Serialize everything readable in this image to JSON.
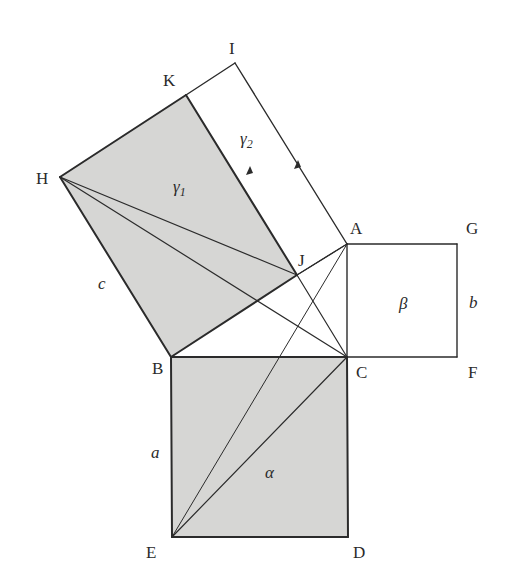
{
  "figure": {
    "colors": {
      "shade": "#d6d6d4",
      "line": "#2b2b2b",
      "background": "#ffffff"
    },
    "points": {
      "A": [
        347,
        244
      ],
      "B": [
        171,
        357
      ],
      "C": [
        347,
        357
      ],
      "D": [
        348,
        537
      ],
      "E": [
        172,
        537
      ],
      "F": [
        457,
        357
      ],
      "G": [
        457,
        244
      ],
      "H": [
        60,
        177
      ],
      "I": [
        235,
        63
      ],
      "J": [
        297,
        275
      ],
      "K": [
        186,
        95
      ]
    },
    "vertex_labels": {
      "A": "A",
      "B": "B",
      "C": "C",
      "D": "D",
      "E": "E",
      "F": "F",
      "G": "G",
      "H": "H",
      "I": "I",
      "J": "J",
      "K": "K"
    },
    "region_labels": {
      "alpha": "α",
      "beta": "β",
      "gamma1": "γ₁",
      "gamma2": "γ₂"
    },
    "side_labels": {
      "a": "a",
      "b": "b",
      "c": "c"
    },
    "shaded_regions": [
      "HKJB (γ1)",
      "BCDE (α)"
    ]
  }
}
